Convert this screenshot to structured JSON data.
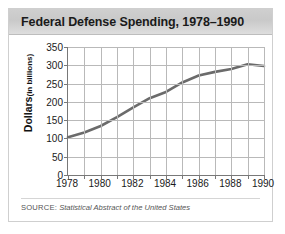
{
  "figure": {
    "title": "Federal Defense Spending, 1978–1990",
    "source_label": "SOURCE:",
    "source_text": "Statistical Abstract of the United States"
  },
  "colors": {
    "line": "#6b6b6b",
    "grid": "#b9b9b9",
    "axis": "#787878",
    "title_bar": "#cfcfcf",
    "text": "#1a1a1a",
    "source_text": "#555555",
    "border": "#cfcfcf"
  },
  "chart_data": {
    "type": "line",
    "title": "Federal Defense Spending, 1978–1990",
    "xlabel": "",
    "ylabel": "Dollars (in billions)",
    "ylabel_main": "Dollars",
    "ylabel_sub": "(in billions)",
    "x": [
      1978,
      1979,
      1980,
      1981,
      1982,
      1983,
      1984,
      1985,
      1986,
      1987,
      1988,
      1989,
      1990
    ],
    "values": [
      103,
      116,
      134,
      158,
      185,
      210,
      227,
      253,
      272,
      282,
      290,
      303,
      298
    ],
    "xlim": [
      1978,
      1990
    ],
    "ylim": [
      0,
      350
    ],
    "yticks": [
      0,
      50,
      100,
      150,
      200,
      250,
      300,
      350
    ],
    "ytick_labels": [
      "0",
      "50",
      "100",
      "150",
      "200",
      "250",
      "300",
      "350"
    ],
    "xticks": [
      1978,
      1980,
      1982,
      1984,
      1986,
      1988,
      1990
    ],
    "xtick_labels": [
      "1978",
      "1980",
      "1982",
      "1984",
      "1986",
      "1988",
      "1990"
    ],
    "xticks_minor": [
      1979,
      1981,
      1983,
      1985,
      1987,
      1989
    ],
    "grid": true,
    "legend": false,
    "series": [
      {
        "name": "Federal Defense Spending",
        "values": [
          103,
          116,
          134,
          158,
          185,
          210,
          227,
          253,
          272,
          282,
          290,
          303,
          298
        ]
      }
    ]
  }
}
